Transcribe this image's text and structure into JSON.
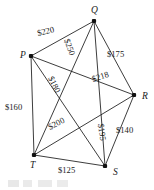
{
  "figure": {
    "background_color": "#ffffff",
    "line_color": "#1a1a1a",
    "width": 154,
    "height": 190
  },
  "graph": {
    "type": "weighted-complete-graph",
    "vertex_count": 5,
    "edge_count": 10,
    "currency_symbol": "$",
    "vertices": [
      {
        "id": "P",
        "label": "P",
        "x": 31,
        "y": 56,
        "label_x": 20,
        "label_y": 58
      },
      {
        "id": "Q",
        "label": "Q",
        "x": 94,
        "y": 21,
        "label_x": 91,
        "label_y": 13
      },
      {
        "id": "R",
        "label": "R",
        "x": 134,
        "y": 95,
        "label_x": 142,
        "label_y": 99
      },
      {
        "id": "S",
        "label": "S",
        "x": 105,
        "y": 166,
        "label_x": 113,
        "label_y": 175
      },
      {
        "id": "T",
        "label": "T",
        "x": 34,
        "y": 155,
        "label_x": 30,
        "label_y": 168
      }
    ],
    "edges": [
      {
        "from": "P",
        "to": "Q",
        "weight": 220,
        "label": "$220",
        "label_x": 38,
        "label_y": 36,
        "rotation": -14
      },
      {
        "from": "Q",
        "to": "R",
        "weight": 175,
        "label": "$175",
        "label_x": 107,
        "label_y": 57,
        "rotation": 0
      },
      {
        "from": "P",
        "to": "R",
        "weight": 218,
        "label": "$218",
        "label_x": 93,
        "label_y": 82,
        "rotation": -18
      },
      {
        "from": "P",
        "to": "T",
        "weight": 160,
        "label": "$160",
        "label_x": 5,
        "label_y": 110,
        "rotation": 0
      },
      {
        "from": "P",
        "to": "S",
        "weight": 180,
        "label": "$180",
        "label_x": 48,
        "label_y": 78,
        "rotation": 64
      },
      {
        "from": "Q",
        "to": "T",
        "weight": 250,
        "label": "$250",
        "label_x": 64,
        "label_y": 40,
        "rotation": 70
      },
      {
        "from": "Q",
        "to": "S",
        "weight": 195,
        "label": "$195",
        "label_x": 98,
        "label_y": 124,
        "rotation": 82
      },
      {
        "from": "R",
        "to": "T",
        "weight": 200,
        "label": "$200",
        "label_x": 50,
        "label_y": 130,
        "rotation": -28
      },
      {
        "from": "R",
        "to": "S",
        "weight": 140,
        "label": "$140",
        "label_x": 116,
        "label_y": 133,
        "rotation": 0
      },
      {
        "from": "T",
        "to": "S",
        "weight": 125,
        "label": "$125",
        "label_x": 58,
        "label_y": 173,
        "rotation": 0
      }
    ]
  }
}
